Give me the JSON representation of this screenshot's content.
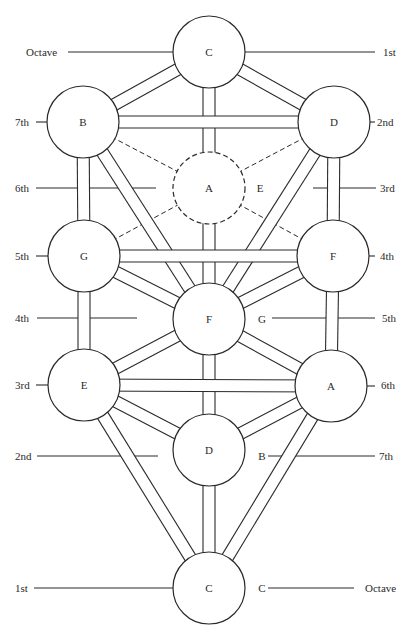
{
  "diagram": {
    "title": "",
    "stroke_color": "#2a2a2a",
    "background": "#ffffff",
    "nodes": [
      {
        "id": "top-c",
        "label": "C",
        "cx": 209,
        "cy": 52,
        "r": 36,
        "dashed": false
      },
      {
        "id": "b",
        "label": "B",
        "cx": 83,
        "cy": 122,
        "r": 36,
        "dashed": false
      },
      {
        "id": "d-top",
        "label": "D",
        "cx": 334,
        "cy": 122,
        "r": 36,
        "dashed": false
      },
      {
        "id": "a-mid",
        "label": "A",
        "cx": 209,
        "cy": 188,
        "r": 36,
        "dashed": true
      },
      {
        "id": "g",
        "label": "G",
        "cx": 84,
        "cy": 256,
        "r": 36,
        "dashed": false
      },
      {
        "id": "f-right",
        "label": "F",
        "cx": 333,
        "cy": 256,
        "r": 36,
        "dashed": false
      },
      {
        "id": "f-center",
        "label": "F",
        "cx": 209,
        "cy": 319,
        "r": 36,
        "dashed": false
      },
      {
        "id": "e",
        "label": "E",
        "cx": 84,
        "cy": 385,
        "r": 36,
        "dashed": false
      },
      {
        "id": "a-right",
        "label": "A",
        "cx": 331,
        "cy": 386,
        "r": 36,
        "dashed": false
      },
      {
        "id": "d-low",
        "label": "D",
        "cx": 209,
        "cy": 450,
        "r": 36,
        "dashed": false
      },
      {
        "id": "bot-c",
        "label": "C",
        "cx": 209,
        "cy": 588,
        "r": 36,
        "dashed": false
      }
    ],
    "paths": [
      {
        "from": "top-c",
        "to": "b"
      },
      {
        "from": "top-c",
        "to": "d-top"
      },
      {
        "from": "top-c",
        "to": "a-mid"
      },
      {
        "from": "b",
        "to": "d-top"
      },
      {
        "from": "b",
        "to": "g"
      },
      {
        "from": "b",
        "to": "f-center"
      },
      {
        "from": "d-top",
        "to": "f-right"
      },
      {
        "from": "d-top",
        "to": "f-center"
      },
      {
        "from": "a-mid",
        "to": "f-center"
      },
      {
        "from": "g",
        "to": "f-right"
      },
      {
        "from": "g",
        "to": "f-center"
      },
      {
        "from": "g",
        "to": "e"
      },
      {
        "from": "f-right",
        "to": "f-center"
      },
      {
        "from": "f-right",
        "to": "a-right"
      },
      {
        "from": "f-center",
        "to": "e"
      },
      {
        "from": "f-center",
        "to": "a-right"
      },
      {
        "from": "f-center",
        "to": "d-low"
      },
      {
        "from": "e",
        "to": "a-right"
      },
      {
        "from": "e",
        "to": "d-low"
      },
      {
        "from": "e",
        "to": "bot-c"
      },
      {
        "from": "a-right",
        "to": "d-low"
      },
      {
        "from": "a-right",
        "to": "bot-c"
      },
      {
        "from": "d-low",
        "to": "bot-c"
      }
    ],
    "dashed_links": [
      {
        "from": "b",
        "to": "a-mid"
      },
      {
        "from": "d-top",
        "to": "a-mid"
      },
      {
        "from": "g",
        "to": "a-mid"
      },
      {
        "from": "f-right",
        "to": "a-mid"
      }
    ],
    "free_labels": [
      {
        "id": "e-beside-a",
        "text": "E",
        "x": 260,
        "y": 192
      },
      {
        "id": "g-beside-f",
        "text": "G",
        "x": 262,
        "y": 323
      },
      {
        "id": "b-beside-d",
        "text": "B",
        "x": 262,
        "y": 460
      },
      {
        "id": "c-beside-c",
        "text": "C",
        "x": 262,
        "y": 592
      }
    ],
    "left_scale": [
      {
        "text": "Octave",
        "tx": 26,
        "ty": 56,
        "x1": 68,
        "x2": 173,
        "y": 52
      },
      {
        "text": "7th",
        "tx": 15,
        "ty": 126,
        "x1": 36,
        "x2": 47,
        "y": 122
      },
      {
        "text": "6th",
        "tx": 15,
        "ty": 192,
        "x1": 36,
        "x2": 156,
        "y": 188
      },
      {
        "text": "5th",
        "tx": 15,
        "ty": 260,
        "x1": 36,
        "x2": 48,
        "y": 256
      },
      {
        "text": "4th",
        "tx": 15,
        "ty": 322,
        "x1": 37,
        "x2": 137,
        "y": 318
      },
      {
        "text": "3rd",
        "tx": 15,
        "ty": 389,
        "x1": 36,
        "x2": 48,
        "y": 385
      },
      {
        "text": "2nd",
        "tx": 15,
        "ty": 460,
        "x1": 37,
        "x2": 158,
        "y": 456
      },
      {
        "text": "1st",
        "tx": 15,
        "ty": 592,
        "x1": 34,
        "x2": 173,
        "y": 588
      }
    ],
    "right_scale": [
      {
        "text": "1st",
        "tx": 383,
        "ty": 56,
        "x1": 245,
        "x2": 375,
        "y": 52
      },
      {
        "text": "2nd",
        "tx": 377,
        "ty": 126,
        "x1": 370,
        "x2": 375,
        "y": 122
      },
      {
        "text": "3rd",
        "tx": 380,
        "ty": 192,
        "x1": 313,
        "x2": 376,
        "y": 188
      },
      {
        "text": "4th",
        "tx": 380,
        "ty": 260,
        "x1": 369,
        "x2": 375,
        "y": 256
      },
      {
        "text": "5th",
        "tx": 382,
        "ty": 322,
        "x1": 272,
        "x2": 375,
        "y": 318
      },
      {
        "text": "6th",
        "tx": 381,
        "ty": 389,
        "x1": 367,
        "x2": 375,
        "y": 386
      },
      {
        "text": "7th",
        "tx": 379,
        "ty": 460,
        "x1": 268,
        "x2": 375,
        "y": 456
      },
      {
        "text": "Octave",
        "tx": 365,
        "ty": 592,
        "x1": 268,
        "x2": 354,
        "y": 588
      }
    ]
  }
}
